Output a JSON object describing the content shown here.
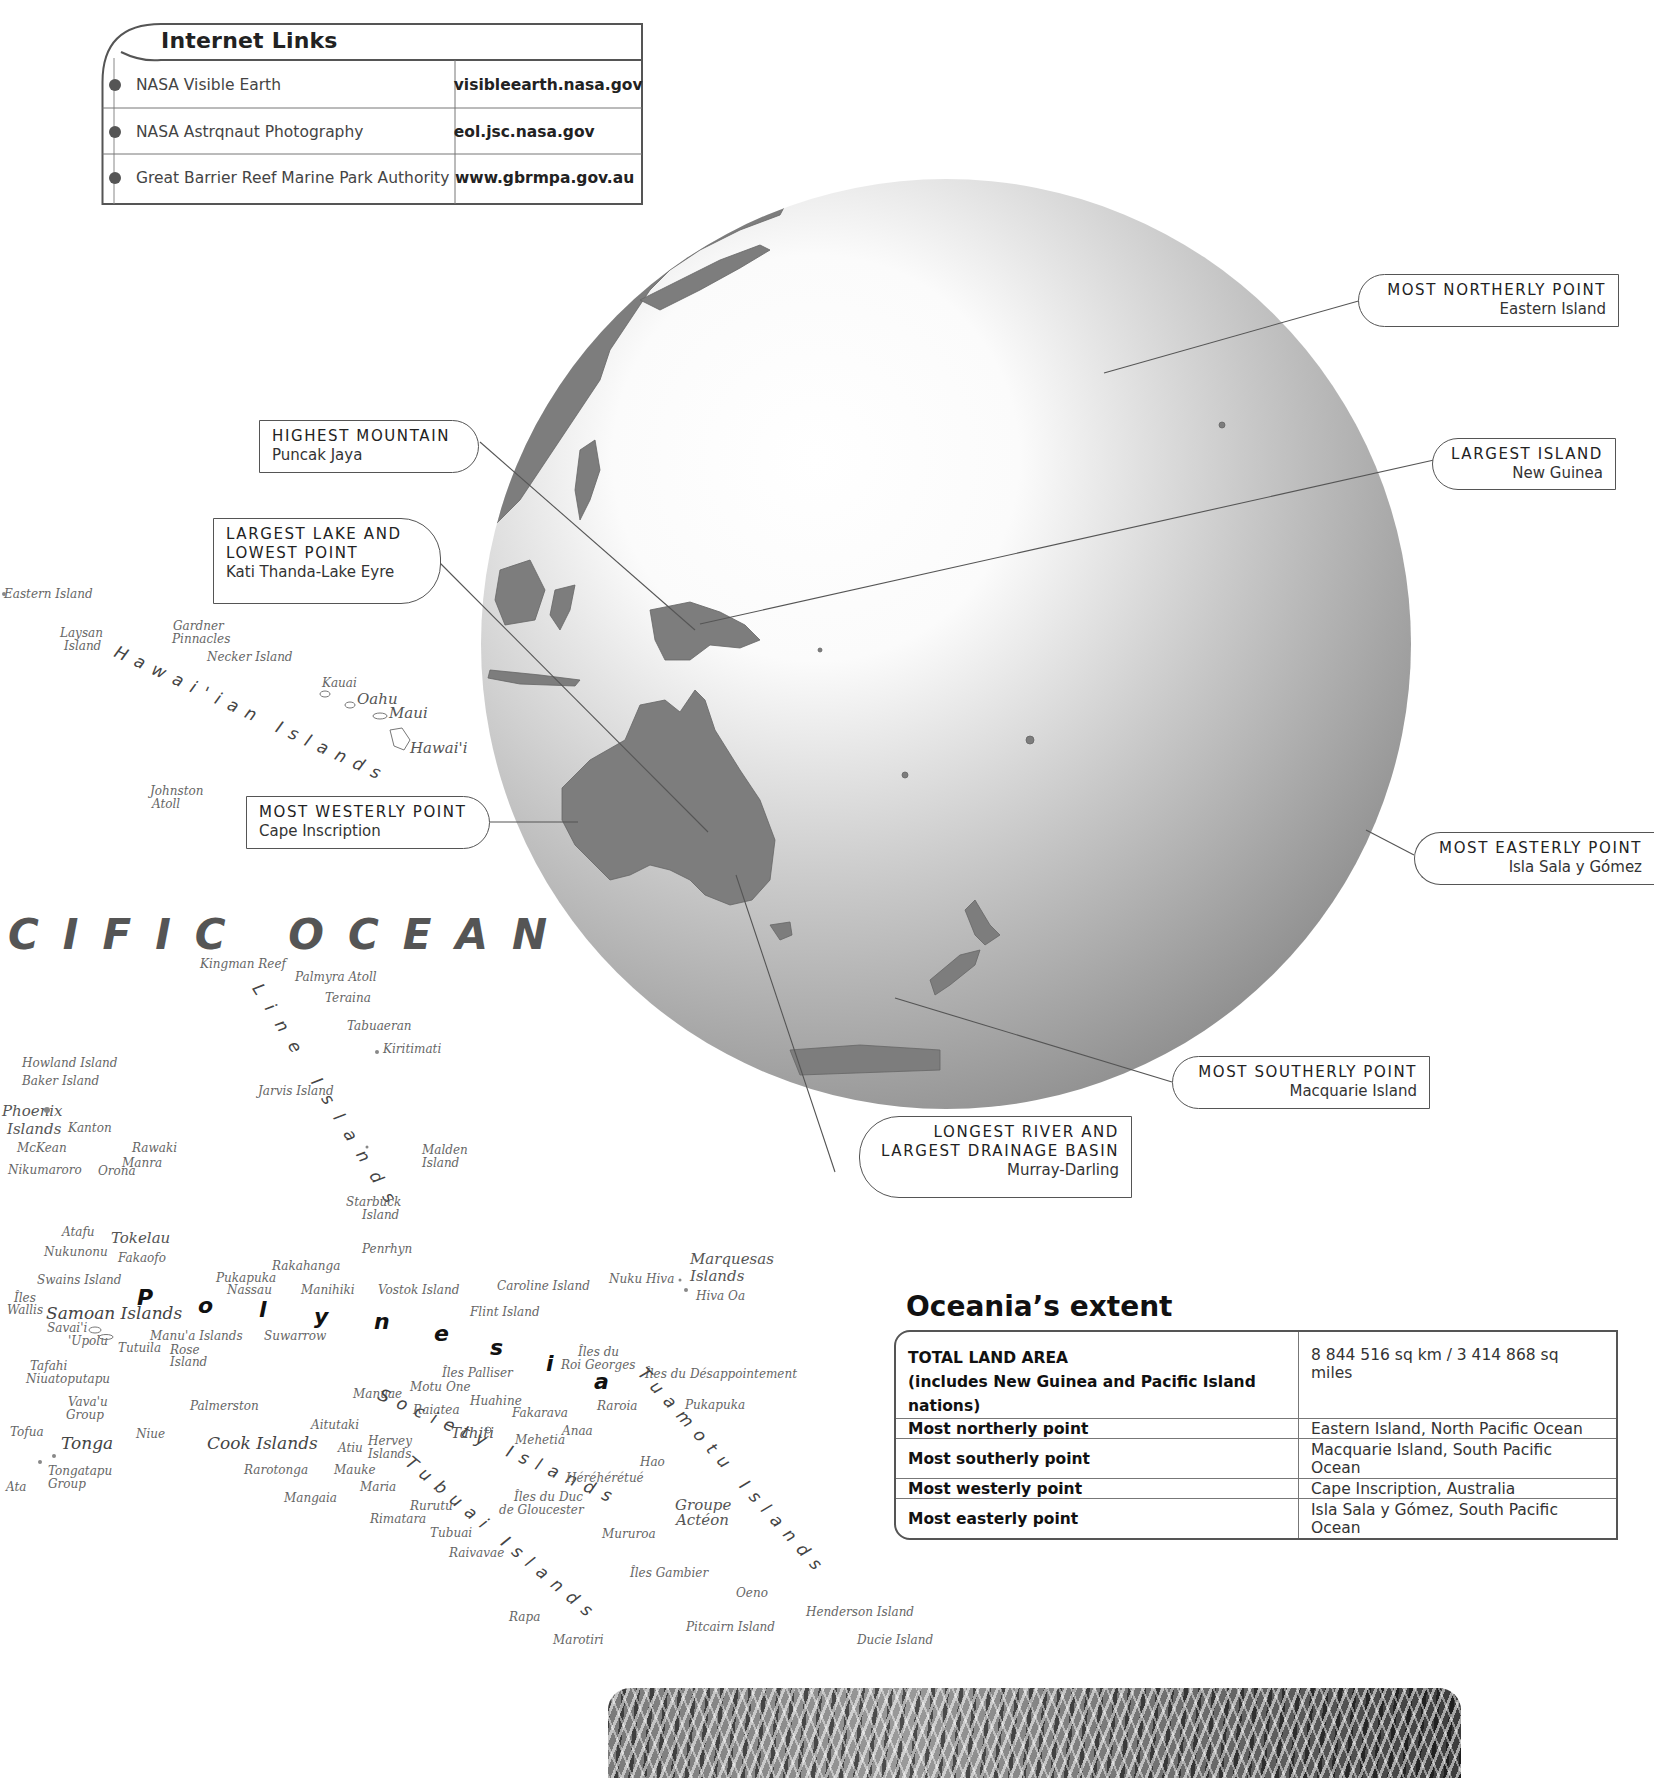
{
  "internet_links": {
    "title": "Internet Links",
    "items": [
      {
        "name": "NASA Visible Earth",
        "url": "visibleearth.nasa.gov"
      },
      {
        "name": "NASA Astrqnaut Photography",
        "url": "eol.jsc.nasa.gov"
      },
      {
        "name": "Great Barrier Reef Marine Park Authority",
        "url": "www.gbrmpa.gov.au"
      }
    ]
  },
  "callouts": {
    "most_northerly": {
      "heading": "MOST NORTHERLY POINT",
      "value": "Eastern Island"
    },
    "highest_mountain": {
      "heading": "HIGHEST MOUNTAIN",
      "value": "Puncak Jaya"
    },
    "largest_island": {
      "heading": "LARGEST ISLAND",
      "value": "New Guinea"
    },
    "largest_lake": {
      "heading_1": "LARGEST LAKE  AND",
      "heading_2": "LOWEST POINT",
      "value": "Kati Thanda-Lake Eyre"
    },
    "most_westerly": {
      "heading": "MOST WESTERLY POINT",
      "value": "Cape Inscription"
    },
    "most_easterly": {
      "heading": "MOST EASTERLY POINT",
      "value": "Isla Sala y Gómez"
    },
    "most_southerly": {
      "heading": "MOST SOUTHERLY POINT",
      "value": "Macquarie Island"
    },
    "longest_river": {
      "heading_1": "LONGEST RIVER AND",
      "heading_2": "LARGEST DRAINAGE BASIN",
      "value": "Murray-Darling"
    }
  },
  "map": {
    "ocean_label": "CIFIC  OCEAN",
    "region_letters": [
      "P",
      "o",
      "l",
      "y",
      "n",
      "e",
      "s",
      "i",
      "a"
    ],
    "arc_labels": {
      "hawaiian": "Hawai'ian  Islands",
      "line": "Line  Islands",
      "society": "Society  Islands",
      "tubuai": "Tubuai  Islands",
      "tuamotu": "Tuamotu  Islands"
    },
    "labels": {
      "eastern_island": "Eastern Island",
      "laysan_1": "Laysan",
      "laysan_2": "Island",
      "gardner_1": "Gardner",
      "gardner_2": "Pinnacles",
      "necker": "Necker Island",
      "kauai": "Kauai",
      "oahu": "Oahu",
      "maui": "Maui",
      "hawaii": "Hawai'i",
      "johnston_1": "Johnston",
      "johnston_2": "Atoll",
      "kingman": "Kingman Reef",
      "palmyra": "Palmyra Atoll",
      "teraina": "Teraina",
      "tabuaeran": "Tabuaeran",
      "kiritimati": "Kiritimati",
      "howland": "Howland Island",
      "baker": "Baker Island",
      "jarvis": "Jarvis Island",
      "phoenix_1": "Phoenix",
      "phoenix_2": "Islands",
      "kanton": "Kanton",
      "mckean": "McKean",
      "rawaki": "Rawaki",
      "manra": "Manra",
      "nikumaroro": "Nikumaroro",
      "orona": "Orona",
      "malden_1": "Malden",
      "malden_2": "Island",
      "starbuck_1": "Starbuck",
      "starbuck_2": "Island",
      "atafu": "Atafu",
      "tokelau": "Tokelau",
      "nukunonu": "Nukunonu",
      "fakaofo": "Fakaofo",
      "penrhyn": "Penrhyn",
      "rakahanga": "Rakahanga",
      "pukapuka_w": "Pukapuka",
      "nassau": "Nassau",
      "manihiki": "Manihiki",
      "swains": "Swains Island",
      "vostok": "Vostok Island",
      "caroline": "Caroline Island",
      "nuku_hiva": "Nuku Hiva",
      "marquesas_1": "Marquesas",
      "marquesas_2": "Islands",
      "hiva_oa": "Hiva Oa",
      "iles_wallis_1": "Îles",
      "iles_wallis_2": "Wallis",
      "samoan": "Samoan Islands",
      "savaii": "Savai'i",
      "upolu": "'Upolu",
      "flint": "Flint Island",
      "manua": "Manu'a Islands",
      "tutuila": "Tutuila",
      "rose_1": "Rose",
      "rose_2": "Island",
      "suwarrow": "Suwarrow",
      "iles_du_1": "Îles du",
      "roi_georges": "Roi Georges",
      "palliser": "Îles Palliser",
      "desappointement": "Îles du Désappointement",
      "tafahi": "Tafahi",
      "niuatoputapu": "Niuatoputapu",
      "motu_one": "Motu One",
      "manuae": "Manuae",
      "huahine": "Huahine",
      "raiatea": "Raiatea",
      "fakarava": "Fakarava",
      "raroia": "Raroia",
      "pukapuka_e": "Pukapuka",
      "vavau_1": "Vava'u",
      "vavau_2": "Group",
      "palmerston": "Palmerston",
      "tofua": "Tofua",
      "niue": "Niue",
      "aitutaki": "Aitutaki",
      "tahiti": "Tahiti",
      "anaa": "Anaa",
      "mehetia": "Mehetia",
      "tonga": "Tonga",
      "cook": "Cook Islands",
      "atiu": "Atiu",
      "hervey_1": "Hervey",
      "hervey_2": "Islands",
      "hao": "Hao",
      "tongatapu_1": "Tongatapu",
      "tongatapu_2": "Group",
      "ata": "Ata",
      "rarotonga": "Rarotonga",
      "mauke": "Mauke",
      "hereheretue": "Héréhérétué",
      "maria": "Maria",
      "mangaia": "Mangaia",
      "duc_1": "Îles du Duc",
      "duc_2": "de Gloucester",
      "groupe_1": "Groupe",
      "groupe_2": "Actéon",
      "rurutu": "Rurutu",
      "rimatara": "Rimatara",
      "mururoa": "Mururoa",
      "tubuai": "Tubuai",
      "raivavae": "Raivavae",
      "gambier": "Îles Gambier",
      "oeno": "Oeno",
      "henderson": "Henderson Island",
      "rapa": "Rapa",
      "pitcairn": "Pitcairn Island",
      "marotiri": "Marotiri",
      "ducie": "Ducie Island"
    }
  },
  "extent": {
    "title": "Oceania’s extent",
    "total_label_1": "TOTAL LAND AREA",
    "total_label_2": "(includes New Guinea and Pacific Island nations)",
    "total_value": "8 844 516 sq km / 3 414 868 sq miles",
    "rows": [
      {
        "label": "Most northerly point",
        "value": "Eastern Island, North Pacific Ocean"
      },
      {
        "label": "Most southerly point",
        "value": "Macquarie Island, South Pacific Ocean"
      },
      {
        "label": "Most westerly point",
        "value": "Cape Inscription, Australia"
      },
      {
        "label": "Most easterly point",
        "value": "Isla Sala y Gómez, South Pacific Ocean"
      }
    ]
  },
  "colors": {
    "ink": "#222222",
    "frame": "#555555",
    "land": "#7a7a7a",
    "globe_light": "#ffffff",
    "globe_dark": "#8a8a8a"
  }
}
